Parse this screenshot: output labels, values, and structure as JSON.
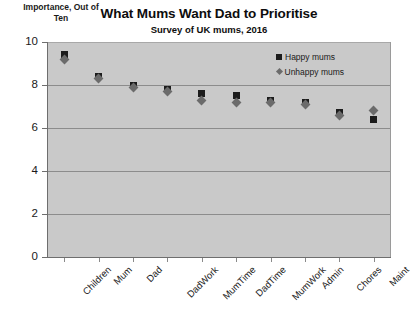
{
  "chart_data": {
    "type": "scatter",
    "title": "What Mums Want Dad to Prioritise",
    "subtitle": "Survey of UK mums, 2016",
    "ylabel": "Importance, Out of Ten",
    "xlabel": "",
    "ylim": [
      0,
      10
    ],
    "yticks": [
      0,
      2,
      4,
      6,
      8,
      10
    ],
    "grid": true,
    "legend_position": "top-right",
    "categories": [
      "Children",
      "Mum",
      "Dad",
      "DadWork",
      "MumTime",
      "DadTime",
      "MumWork",
      "Admin",
      "Chores",
      "Maint"
    ],
    "series": [
      {
        "name": "Happy mums",
        "marker": "square",
        "color": "#1c1c1c",
        "values": [
          9.4,
          8.4,
          8.0,
          7.8,
          7.6,
          7.5,
          7.3,
          7.2,
          6.7,
          6.4
        ]
      },
      {
        "name": "Unhappy mums",
        "marker": "diamond",
        "color": "#6b6b6b",
        "values": [
          9.2,
          8.3,
          7.9,
          7.7,
          7.3,
          7.2,
          7.2,
          7.1,
          6.6,
          6.8
        ]
      }
    ]
  },
  "axis": {
    "y_tick_labels": [
      "10",
      "8",
      "6",
      "4",
      "2",
      "0"
    ]
  },
  "legend": {
    "items": [
      {
        "label": "Happy mums"
      },
      {
        "label": "Unhappy mums"
      }
    ]
  }
}
